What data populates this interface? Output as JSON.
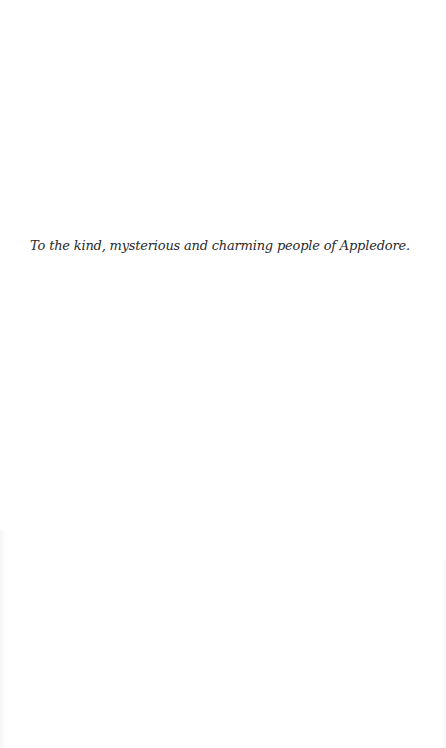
{
  "page": {
    "dedication": "To the kind, mysterious and charming people of Appledore."
  }
}
